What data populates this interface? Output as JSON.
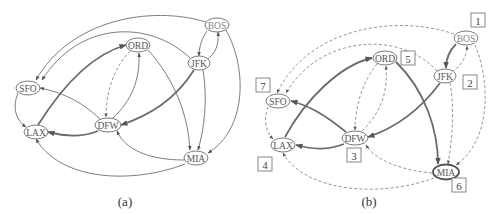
{
  "figure": {
    "panel_a": {
      "caption": "(a)",
      "nodes": {
        "BOS": "BOS",
        "JFK": "JFK",
        "ORD": "ORD",
        "SFO": "SFO",
        "DFW": "DFW",
        "LAX": "LAX",
        "MIA": "MIA"
      },
      "edges": [
        {
          "from": "BOS",
          "to": "JFK",
          "style": "solid"
        },
        {
          "from": "JFK",
          "to": "BOS",
          "style": "solid"
        },
        {
          "from": "BOS",
          "to": "SFO",
          "style": "solid"
        },
        {
          "from": "JFK",
          "to": "SFO",
          "style": "solid"
        },
        {
          "from": "BOS",
          "to": "MIA",
          "style": "solid"
        },
        {
          "from": "JFK",
          "to": "MIA",
          "style": "solid"
        },
        {
          "from": "JFK",
          "to": "DFW",
          "style": "thick"
        },
        {
          "from": "ORD",
          "to": "DFW",
          "style": "dashed"
        },
        {
          "from": "DFW",
          "to": "ORD",
          "style": "solid"
        },
        {
          "from": "ORD",
          "to": "MIA",
          "style": "solid"
        },
        {
          "from": "LAX",
          "to": "ORD",
          "style": "thick"
        },
        {
          "from": "DFW",
          "to": "SFO",
          "style": "solid"
        },
        {
          "from": "DFW",
          "to": "LAX",
          "style": "thick"
        },
        {
          "from": "SFO",
          "to": "LAX",
          "style": "solid"
        },
        {
          "from": "MIA",
          "to": "DFW",
          "style": "solid"
        },
        {
          "from": "MIA",
          "to": "LAX",
          "style": "solid"
        }
      ]
    },
    "panel_b": {
      "caption": "(b)",
      "nodes": {
        "BOS": "BOS",
        "JFK": "JFK",
        "ORD": "ORD",
        "SFO": "SFO",
        "DFW": "DFW",
        "LAX": "LAX",
        "MIA": "MIA"
      },
      "visit_order": {
        "BOS": "1",
        "JFK": "2",
        "DFW": "3",
        "LAX": "4",
        "ORD": "5",
        "MIA": "6",
        "SFO": "7"
      },
      "edges": [
        {
          "from": "BOS",
          "to": "JFK",
          "style": "thick"
        },
        {
          "from": "JFK",
          "to": "BOS",
          "style": "dashed"
        },
        {
          "from": "BOS",
          "to": "SFO",
          "style": "dashed"
        },
        {
          "from": "JFK",
          "to": "SFO",
          "style": "dashed"
        },
        {
          "from": "BOS",
          "to": "MIA",
          "style": "dashed"
        },
        {
          "from": "JFK",
          "to": "MIA",
          "style": "dashed"
        },
        {
          "from": "JFK",
          "to": "DFW",
          "style": "thick"
        },
        {
          "from": "ORD",
          "to": "DFW",
          "style": "dashed"
        },
        {
          "from": "DFW",
          "to": "ORD",
          "style": "dashed"
        },
        {
          "from": "ORD",
          "to": "MIA",
          "style": "thick"
        },
        {
          "from": "LAX",
          "to": "ORD",
          "style": "thick"
        },
        {
          "from": "DFW",
          "to": "SFO",
          "style": "thick"
        },
        {
          "from": "DFW",
          "to": "LAX",
          "style": "thick"
        },
        {
          "from": "SFO",
          "to": "LAX",
          "style": "dashed"
        },
        {
          "from": "MIA",
          "to": "DFW",
          "style": "dashed"
        },
        {
          "from": "MIA",
          "to": "LAX",
          "style": "dashed"
        }
      ]
    }
  },
  "colors": {
    "edge": "#6e6e6e",
    "node_stroke": "#7a7a7a",
    "label": "#555555",
    "background": "#ffffff"
  }
}
